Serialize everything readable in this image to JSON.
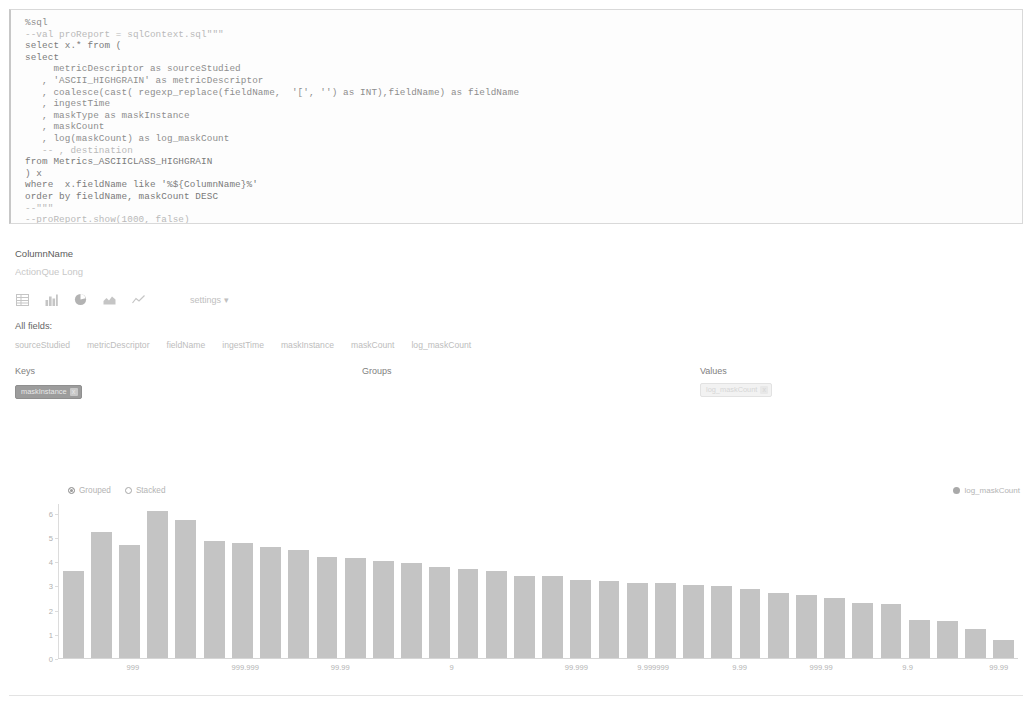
{
  "code_cell": {
    "lines": [
      "%sql",
      "--val proReport = sqlContext.sql\"\"\"",
      "select x.* from (",
      "select",
      "     metricDescriptor as sourceStudied",
      "   , 'ASCII_HIGHGRAIN' as metricDescriptor",
      "   , coalesce(cast( regexp_replace(fieldName,  '[', '') as INT),fieldName) as fieldName",
      "   , ingestTime",
      "   , maskType as maskInstance",
      "   , maskCount",
      "   , log(maskCount) as log_maskCount",
      "   -- , destination",
      "from Metrics_ASCIICLASS_HIGHGRAIN",
      ") x",
      "where  x.fieldName like '%${ColumnName}%'",
      "order by fieldName, maskCount DESC",
      "--\"\"\"",
      "--proReport.show(1000, false)"
    ]
  },
  "parameter": {
    "label": "ColumnName",
    "value": "",
    "placeholder": "ActionQue Long"
  },
  "viz_toolbar": {
    "buttons": [
      {
        "name": "table-icon",
        "title": "Table"
      },
      {
        "name": "bar-chart-icon",
        "title": "Bar chart"
      },
      {
        "name": "pie-chart-icon",
        "title": "Pie chart"
      },
      {
        "name": "area-chart-icon",
        "title": "Area chart"
      },
      {
        "name": "line-chart-icon",
        "title": "Line chart"
      }
    ],
    "settings_label": "settings ▾"
  },
  "all_fields": {
    "label": "All fields:",
    "fields": [
      "sourceStudied",
      "metricDescriptor",
      "fieldName",
      "ingestTime",
      "maskInstance",
      "maskCount",
      "log_maskCount"
    ]
  },
  "pivot": {
    "keys_label": "Keys",
    "groups_label": "Groups",
    "values_label": "Values",
    "keys": [
      {
        "label": "maskInstance",
        "remove": "x"
      }
    ],
    "groups": [],
    "values": [
      {
        "label": "log_maskCount",
        "remove": "x"
      }
    ]
  },
  "chart_mode": {
    "options": [
      {
        "label": "Grouped",
        "selected": true
      },
      {
        "label": "Stacked",
        "selected": false
      }
    ]
  },
  "chart_data": {
    "type": "bar",
    "title": "",
    "xlabel": "",
    "ylabel": "",
    "ylim": [
      0,
      6.4
    ],
    "grid": false,
    "legend_position": "top-right",
    "legend": [
      "log_maskCount"
    ],
    "series": [
      {
        "name": "log_maskCount",
        "color": "#c4c4c4",
        "values": [
          3.6,
          5.25,
          4.7,
          6.1,
          5.75,
          4.85,
          4.8,
          4.6,
          4.5,
          4.2,
          4.15,
          4.05,
          3.95,
          3.8,
          3.7,
          3.6,
          3.4,
          3.4,
          3.25,
          3.2,
          3.1,
          3.1,
          3.05,
          3.0,
          2.85,
          2.7,
          2.6,
          2.5,
          2.3,
          2.25,
          1.6,
          1.55,
          1.2,
          0.75
        ]
      }
    ],
    "ytick_labels": [
      "6",
      "5",
      "4",
      "3",
      "2",
      "1",
      "0"
    ],
    "ytick_values": [
      6,
      5,
      4,
      3,
      2,
      1,
      0
    ],
    "xtick_labels": [
      {
        "label": "999",
        "index": 3
      },
      {
        "label": "999.999",
        "index": 8
      },
      {
        "label": "99.99",
        "index": 13
      },
      {
        "label": "9",
        "index": 18
      },
      {
        "label": "99.999",
        "index": 23
      },
      {
        "label": "9.999999",
        "index": 26
      },
      {
        "label": "9.99",
        "index": 29
      },
      {
        "label": "999.99",
        "index": 32
      },
      {
        "label": "9.9",
        "index": 36
      },
      {
        "label": "99.99",
        "index": 40
      }
    ],
    "xtick_positions_pct": [
      7.8,
      19.5,
      29.4,
      41.0,
      54.0,
      62.0,
      71.0,
      79.5,
      88.5,
      98.0
    ]
  }
}
